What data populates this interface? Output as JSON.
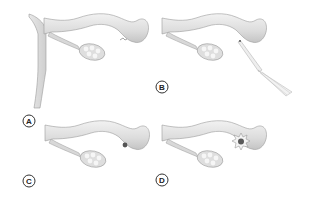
{
  "figure": {
    "panels": [
      {
        "id": "A",
        "label": "A",
        "feature": "uterine wall with tube and ovary; fimbrial end closed"
      },
      {
        "id": "B",
        "label": "B",
        "feature": "tube with beam/instrument directed at fimbrial end"
      },
      {
        "id": "C",
        "label": "C",
        "feature": "tube with small dark occluded spot at fimbrial end"
      },
      {
        "id": "D",
        "label": "D",
        "feature": "tube with starburst lesion at fimbrial end"
      }
    ]
  },
  "colors": {
    "tissue_fill": "#e4e4e4",
    "tissue_shade": "#c9c9c9",
    "outline": "#9a9a9a",
    "label_stroke": "#333333",
    "lesion": "#555555"
  }
}
